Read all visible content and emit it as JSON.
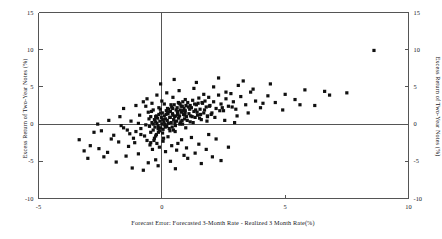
{
  "chart_data": {
    "type": "scatter",
    "title": "",
    "xlabel": "Forecast Error: Forecasted 3-Month Rate - Realized 3 Month Rate(%)",
    "ylabel": "Excess Return of Two-Year Notes (%)",
    "ylabel_right": "Excess Return of Two-Year Notes (%)",
    "xlim": [
      -5,
      10
    ],
    "ylim": [
      -10,
      15
    ],
    "xticks": [
      -5,
      0,
      5,
      10
    ],
    "xtick_labels": [
      "-5",
      "0",
      "5",
      "10"
    ],
    "yticks": [
      -10,
      -5,
      0,
      5,
      10,
      15
    ],
    "ytick_labels": [
      "-10",
      "-5",
      "0",
      "5",
      "10",
      "15"
    ],
    "ytick_labels_right": [
      "-10",
      "-5",
      "0",
      "5",
      "10",
      "15"
    ],
    "grid": false,
    "legend": null,
    "marker": "square",
    "marker_color": "#101010",
    "marker_size": 3.2,
    "zero_lines": {
      "x": 0,
      "y": 0
    },
    "n_points": 268,
    "points": [
      [
        -1.55,
        2.1
      ],
      [
        -2.05,
        -2.0
      ],
      [
        -2.55,
        -3.3
      ],
      [
        -2.2,
        -3.8
      ],
      [
        -1.75,
        -2.4
      ],
      [
        -1.45,
        -4.3
      ],
      [
        -1.1,
        -2.5
      ],
      [
        -0.95,
        -4.0
      ],
      [
        -1.3,
        -1.3
      ],
      [
        -1.05,
        -1.0
      ],
      [
        -0.85,
        -0.6
      ],
      [
        -0.7,
        -1.6
      ],
      [
        -0.6,
        -2.2
      ],
      [
        -0.5,
        -0.3
      ],
      [
        -0.45,
        -1.1
      ],
      [
        -0.4,
        0.2
      ],
      [
        -0.35,
        -0.8
      ],
      [
        -0.3,
        0.6
      ],
      [
        -0.28,
        -0.4
      ],
      [
        -0.25,
        1.0
      ],
      [
        -0.22,
        -1.4
      ],
      [
        -0.2,
        0.1
      ],
      [
        -0.18,
        0.8
      ],
      [
        -0.15,
        -0.2
      ],
      [
        -0.12,
        1.3
      ],
      [
        -0.1,
        -0.9
      ],
      [
        -0.08,
        0.4
      ],
      [
        -0.05,
        -0.5
      ],
      [
        -0.02,
        0.9
      ],
      [
        0.0,
        0.0
      ],
      [
        0.02,
        1.5
      ],
      [
        0.05,
        -0.7
      ],
      [
        0.08,
        0.3
      ],
      [
        0.1,
        1.1
      ],
      [
        0.12,
        -0.1
      ],
      [
        0.15,
        0.7
      ],
      [
        0.18,
        1.8
      ],
      [
        0.2,
        -0.3
      ],
      [
        0.22,
        0.5
      ],
      [
        0.25,
        1.4
      ],
      [
        0.28,
        2.0
      ],
      [
        0.3,
        -0.6
      ],
      [
        0.32,
        0.9
      ],
      [
        0.35,
        1.7
      ],
      [
        0.38,
        0.2
      ],
      [
        0.4,
        2.3
      ],
      [
        0.42,
        -0.4
      ],
      [
        0.45,
        1.2
      ],
      [
        0.48,
        0.6
      ],
      [
        0.5,
        2.6
      ],
      [
        0.52,
        1.0
      ],
      [
        0.55,
        -0.2
      ],
      [
        0.58,
        1.9
      ],
      [
        0.6,
        0.4
      ],
      [
        0.62,
        2.2
      ],
      [
        0.65,
        1.5
      ],
      [
        0.68,
        0.8
      ],
      [
        0.7,
        2.8
      ],
      [
        0.72,
        1.1
      ],
      [
        0.75,
        0.1
      ],
      [
        0.78,
        2.4
      ],
      [
        0.8,
        1.6
      ],
      [
        0.82,
        0.5
      ],
      [
        0.85,
        3.0
      ],
      [
        0.88,
        1.3
      ],
      [
        0.9,
        2.1
      ],
      [
        0.92,
        0.7
      ],
      [
        0.95,
        1.8
      ],
      [
        0.98,
        2.5
      ],
      [
        1.0,
        1.0
      ],
      [
        1.05,
        2.9
      ],
      [
        1.1,
        1.4
      ],
      [
        1.15,
        0.3
      ],
      [
        1.2,
        2.2
      ],
      [
        1.25,
        3.2
      ],
      [
        1.3,
        1.7
      ],
      [
        1.35,
        0.9
      ],
      [
        1.4,
        2.6
      ],
      [
        1.45,
        1.2
      ],
      [
        1.5,
        3.5
      ],
      [
        1.55,
        2.0
      ],
      [
        1.6,
        0.6
      ],
      [
        1.65,
        2.8
      ],
      [
        1.7,
        1.5
      ],
      [
        1.75,
        3.1
      ],
      [
        1.8,
        2.3
      ],
      [
        1.85,
        1.0
      ],
      [
        1.9,
        3.6
      ],
      [
        1.95,
        2.5
      ],
      [
        2.0,
        1.3
      ],
      [
        2.1,
        3.0
      ],
      [
        2.2,
        2.1
      ],
      [
        2.3,
        3.9
      ],
      [
        2.4,
        2.7
      ],
      [
        2.5,
        1.8
      ],
      [
        2.6,
        3.4
      ],
      [
        2.7,
        2.4
      ],
      [
        2.8,
        4.1
      ],
      [
        2.9,
        3.0
      ],
      [
        3.0,
        2.0
      ],
      [
        3.2,
        3.7
      ],
      [
        3.4,
        2.6
      ],
      [
        3.6,
        4.3
      ],
      [
        3.8,
        3.1
      ],
      [
        4.0,
        2.2
      ],
      [
        4.3,
        3.8
      ],
      [
        4.6,
        2.9
      ],
      [
        5.0,
        4.0
      ],
      [
        5.4,
        3.3
      ],
      [
        5.8,
        4.6
      ],
      [
        6.2,
        2.5
      ],
      [
        6.8,
        3.9
      ],
      [
        7.5,
        4.2
      ],
      [
        8.6,
        9.9
      ],
      [
        6.6,
        4.4
      ],
      [
        -0.55,
        -5.2
      ],
      [
        -0.15,
        -5.6
      ],
      [
        0.35,
        -5.0
      ],
      [
        1.05,
        -4.6
      ],
      [
        1.6,
        -5.3
      ],
      [
        -1.85,
        -5.1
      ],
      [
        -2.35,
        -4.4
      ],
      [
        -0.75,
        -6.2
      ],
      [
        0.55,
        -6.0
      ],
      [
        2.4,
        -4.9
      ],
      [
        -2.9,
        -2.9
      ],
      [
        -3.15,
        -3.6
      ],
      [
        -1.95,
        -1.5
      ],
      [
        -2.45,
        -0.9
      ],
      [
        -1.65,
        -0.2
      ],
      [
        -1.25,
        0.4
      ],
      [
        -0.9,
        1.2
      ],
      [
        -0.65,
        2.4
      ],
      [
        -0.48,
        -2.8
      ],
      [
        -0.38,
        -3.4
      ],
      [
        -0.3,
        -1.9
      ],
      [
        -0.2,
        -2.6
      ],
      [
        -0.1,
        -3.1
      ],
      [
        0.05,
        -2.3
      ],
      [
        0.15,
        -3.7
      ],
      [
        0.25,
        -1.7
      ],
      [
        0.4,
        -2.9
      ],
      [
        0.6,
        -3.5
      ],
      [
        0.8,
        -2.1
      ],
      [
        1.0,
        -3.2
      ],
      [
        1.2,
        -1.8
      ],
      [
        1.5,
        -2.7
      ],
      [
        1.8,
        -3.4
      ],
      [
        2.2,
        -2.0
      ],
      [
        2.7,
        -3.1
      ],
      [
        -0.6,
        3.4
      ],
      [
        -0.4,
        2.8
      ],
      [
        -0.2,
        3.9
      ],
      [
        0.0,
        3.1
      ],
      [
        0.2,
        4.2
      ],
      [
        0.45,
        3.6
      ],
      [
        0.7,
        4.5
      ],
      [
        0.95,
        3.3
      ],
      [
        1.3,
        4.8
      ],
      [
        1.7,
        4.0
      ],
      [
        2.1,
        5.0
      ],
      [
        2.6,
        4.3
      ],
      [
        3.1,
        5.2
      ],
      [
        3.7,
        4.7
      ],
      [
        4.4,
        5.4
      ],
      [
        -0.05,
        5.4
      ],
      [
        0.5,
        6.0
      ],
      [
        1.4,
        5.6
      ],
      [
        2.3,
        6.2
      ],
      [
        3.3,
        5.8
      ],
      [
        -2.75,
        -1.1
      ],
      [
        -3.35,
        -2.1
      ],
      [
        -1.35,
        -3.0
      ],
      [
        -0.95,
        0.1
      ],
      [
        -0.55,
        1.6
      ],
      [
        0.1,
        2.7
      ],
      [
        0.75,
        1.9
      ],
      [
        1.15,
        2.5
      ],
      [
        1.85,
        1.1
      ],
      [
        2.45,
        2.2
      ],
      [
        -0.35,
        0.0
      ],
      [
        -0.25,
        0.3
      ],
      [
        -0.15,
        -0.6
      ],
      [
        -0.05,
        1.5
      ],
      [
        0.03,
        -1.2
      ],
      [
        0.13,
        0.0
      ],
      [
        0.23,
        2.1
      ],
      [
        0.33,
        -0.9
      ],
      [
        0.43,
        1.4
      ],
      [
        0.53,
        0.2
      ],
      [
        0.63,
        1.7
      ],
      [
        0.73,
        0.0
      ],
      [
        0.83,
        2.4
      ],
      [
        0.93,
        1.2
      ],
      [
        1.03,
        0.5
      ],
      [
        1.13,
        2.0
      ],
      [
        1.23,
        1.0
      ],
      [
        1.33,
        2.7
      ],
      [
        1.43,
        1.6
      ],
      [
        1.53,
        0.8
      ],
      [
        1.63,
        2.9
      ],
      [
        1.73,
        1.9
      ],
      [
        1.83,
        0.4
      ],
      [
        1.93,
        2.4
      ],
      [
        2.03,
        1.5
      ],
      [
        -0.45,
        1.0
      ],
      [
        -0.35,
        1.9
      ],
      [
        -0.25,
        -1.6
      ],
      [
        -0.12,
        2.2
      ],
      [
        0.07,
        -1.9
      ],
      [
        0.17,
        1.3
      ],
      [
        0.27,
        0.1
      ],
      [
        0.37,
        2.6
      ],
      [
        0.47,
        -0.8
      ],
      [
        0.57,
        1.1
      ],
      [
        0.67,
        2.9
      ],
      [
        0.77,
        0.3
      ],
      [
        0.87,
        1.8
      ],
      [
        0.97,
        -0.5
      ],
      [
        1.07,
        2.3
      ],
      [
        -1.15,
        -1.9
      ],
      [
        -1.55,
        -0.5
      ],
      [
        -0.85,
        -1.4
      ],
      [
        -0.65,
        -0.1
      ],
      [
        -0.52,
        0.7
      ],
      [
        -0.42,
        1.7
      ],
      [
        -0.32,
        -2.2
      ],
      [
        -0.22,
        1.1
      ],
      [
        -0.14,
        -1.1
      ],
      [
        -0.06,
        2.0
      ],
      [
        0.04,
        0.6
      ],
      [
        0.14,
        -0.4
      ],
      [
        0.24,
        1.6
      ],
      [
        0.34,
        0.9
      ],
      [
        0.44,
        2.1
      ],
      [
        0.54,
        -1.0
      ],
      [
        0.64,
        1.3
      ],
      [
        0.74,
        2.7
      ],
      [
        0.84,
        0.0
      ],
      [
        0.94,
        1.5
      ],
      [
        1.17,
        1.1
      ],
      [
        1.27,
        0.2
      ],
      [
        1.37,
        1.9
      ],
      [
        1.47,
        2.8
      ],
      [
        1.57,
        1.3
      ],
      [
        2.15,
        0.9
      ],
      [
        2.35,
        1.8
      ],
      [
        2.55,
        0.5
      ],
      [
        2.85,
        2.3
      ],
      [
        3.05,
        1.1
      ],
      [
        -1.05,
        2.5
      ],
      [
        -0.75,
        3.0
      ],
      [
        -0.45,
        -2.5
      ],
      [
        0.65,
        -2.6
      ],
      [
        1.9,
        -1.4
      ],
      [
        3.5,
        1.5
      ],
      [
        4.1,
        2.8
      ],
      [
        4.9,
        1.9
      ],
      [
        5.6,
        2.6
      ],
      [
        2.95,
        0.2
      ],
      [
        -2.15,
        0.5
      ],
      [
        -2.6,
        0.0
      ],
      [
        -1.7,
        1.0
      ],
      [
        -1.4,
        -0.8
      ],
      [
        -3.0,
        -4.6
      ],
      [
        0.9,
        -4.2
      ],
      [
        -0.25,
        -4.8
      ],
      [
        1.35,
        -3.9
      ],
      [
        2.05,
        -4.4
      ],
      [
        -1.2,
        -5.9
      ]
    ]
  },
  "axes": {
    "frame_color": "#555555",
    "zero_line_color": "#555555"
  }
}
